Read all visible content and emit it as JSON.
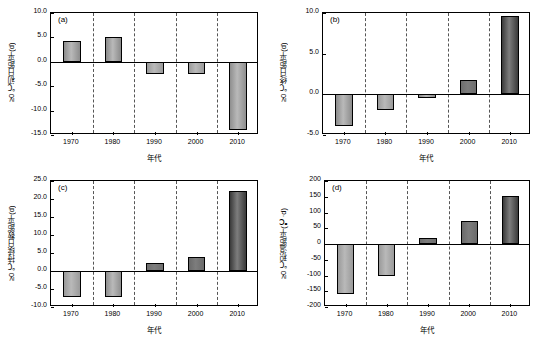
{
  "figure": {
    "width": 545,
    "height": 342,
    "background": "#ffffff"
  },
  "chart_data": [
    {
      "id": "a",
      "type": "bar",
      "panel_label": "(a)",
      "title": "",
      "xlabel": "年代",
      "ylabel": "≥0 ℃初日距平(d)",
      "categories": [
        "1970",
        "1980",
        "1990",
        "2000",
        "2010"
      ],
      "values": [
        4.3,
        5.1,
        -2.6,
        -2.4,
        -14.0
      ],
      "ylim": [
        -15.0,
        10.0
      ],
      "yticks": [
        "10.0",
        "5.0",
        "0.0",
        "-5.0",
        "-10.0",
        "-15.0"
      ],
      "ytick_values": [
        10.0,
        5.0,
        0.0,
        -5.0,
        -10.0,
        -15.0
      ],
      "grid": "vertical-dashed",
      "bar_colors": [
        "#8c8c8c",
        "#8a8a8a",
        "#9a9a9a",
        "#9a9a9a",
        "#8f8f8f"
      ]
    },
    {
      "id": "b",
      "type": "bar",
      "panel_label": "(b)",
      "title": "",
      "xlabel": "年代",
      "ylabel": "≥0 ℃终日距平(d)",
      "categories": [
        "1970",
        "1980",
        "1990",
        "2000",
        "2010"
      ],
      "values": [
        -3.9,
        -1.9,
        -0.4,
        1.8,
        9.6
      ],
      "ylim": [
        -5.0,
        10.0
      ],
      "yticks": [
        "10.0",
        "5.0",
        "0.0",
        "-5.0"
      ],
      "ytick_values": [
        10.0,
        5.0,
        0.0,
        -5.0
      ],
      "grid": "vertical-dashed",
      "bar_colors": [
        "#8c8c8c",
        "#9a9a9a",
        "#8a8a8a",
        "#6e6e6e",
        "#3a3a3a"
      ]
    },
    {
      "id": "c",
      "type": "bar",
      "panel_label": "(c)",
      "title": "",
      "xlabel": "年代",
      "ylabel": "≥0 ℃持续日数距平(d)",
      "categories": [
        "1970",
        "1980",
        "1990",
        "2000",
        "2010"
      ],
      "values": [
        -7.2,
        -7.3,
        2.2,
        4.0,
        22.1
      ],
      "ylim": [
        -10.0,
        25.0
      ],
      "yticks": [
        "25.0",
        "20.0",
        "15.0",
        "10.0",
        "5.0",
        "0.0",
        "-5.0",
        "-10.0"
      ],
      "ytick_values": [
        25.0,
        20.0,
        15.0,
        10.0,
        5.0,
        0.0,
        -5.0,
        -10.0
      ],
      "grid": "vertical-dashed",
      "bar_colors": [
        "#9a9a9a",
        "#8f8f8f",
        "#6e6e6e",
        "#6a6a6a",
        "#3a3a3a"
      ]
    },
    {
      "id": "d",
      "type": "bar",
      "panel_label": "(d)",
      "title": "",
      "xlabel": "年代",
      "ylabel": "≥0 ℃积温距平(℃·d)",
      "categories": [
        "1970",
        "1980",
        "1990",
        "2000",
        "2010"
      ],
      "values": [
        -158,
        -100,
        20,
        72,
        152
      ],
      "ylim": [
        -200,
        200
      ],
      "yticks": [
        "200",
        "150",
        "100",
        "50",
        "0",
        "-50",
        "-100",
        "-150",
        "-200"
      ],
      "ytick_values": [
        200,
        150,
        100,
        50,
        0,
        -50,
        -100,
        -150,
        -200
      ],
      "grid": "vertical-dashed",
      "bar_colors": [
        "#9a9a9a",
        "#9a9a9a",
        "#6e6e6e",
        "#6a6a6a",
        "#3a3a3a"
      ]
    }
  ]
}
